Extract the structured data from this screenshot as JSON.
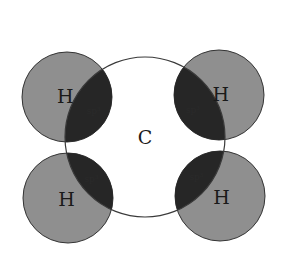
{
  "diagram": {
    "title": "",
    "colors": {
      "background": "#ffffff",
      "hydrogen_fill": "#8f8f8f",
      "overlap_fill": "#262626",
      "carbon_stroke": "#3a3a3a",
      "outline": "#333333"
    },
    "carbon": {
      "label": "C",
      "cx": 145,
      "cy": 137,
      "r": 80
    },
    "hydrogens": [
      {
        "id": "h-top-left",
        "label": "H",
        "cx": 67,
        "cy": 97,
        "r": 45,
        "overlap_label": "sp³"
      },
      {
        "id": "h-top-right",
        "label": "H",
        "cx": 219,
        "cy": 95,
        "r": 45,
        "overlap_label": "sp³"
      },
      {
        "id": "h-bottom-left",
        "label": "H",
        "cx": 68,
        "cy": 198,
        "r": 45,
        "overlap_label": "sp³"
      },
      {
        "id": "h-bottom-right",
        "label": "H",
        "cx": 220,
        "cy": 196,
        "r": 45,
        "overlap_label": "sp³"
      }
    ]
  }
}
